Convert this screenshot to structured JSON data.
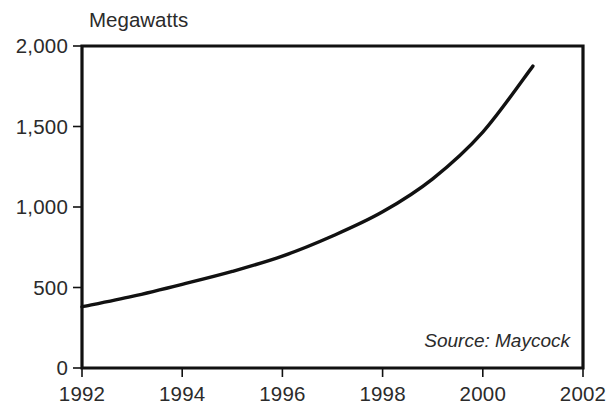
{
  "chart_data": {
    "type": "line",
    "title": "",
    "ylabel": "Megawatts",
    "xlabel": "",
    "x": [
      1992,
      1993,
      1994,
      1995,
      1996,
      1997,
      1998,
      1999,
      2000,
      2001
    ],
    "values": [
      380,
      445,
      520,
      600,
      695,
      820,
      970,
      1175,
      1465,
      1875
    ],
    "series": [
      {
        "name": "Megawatts",
        "values": [
          380,
          445,
          520,
          600,
          695,
          820,
          970,
          1175,
          1465,
          1875
        ]
      }
    ],
    "xlim": [
      1992,
      2002
    ],
    "ylim": [
      0,
      2000
    ],
    "ytick_values": [
      0,
      500,
      1000,
      1500,
      2000
    ],
    "ytick_labels": [
      "0",
      "500",
      "1,000",
      "1,500",
      "2,000"
    ],
    "xtick_values": [
      1992,
      1994,
      1996,
      1998,
      2000,
      2002
    ],
    "xtick_labels": [
      "1992",
      "1994",
      "1996",
      "1998",
      "2000",
      "2002"
    ],
    "grid": false,
    "legend": false,
    "annotation": "Source: Maycock",
    "line_color": "#111111",
    "axis_color": "#111111",
    "background_color": "#ffffff"
  }
}
